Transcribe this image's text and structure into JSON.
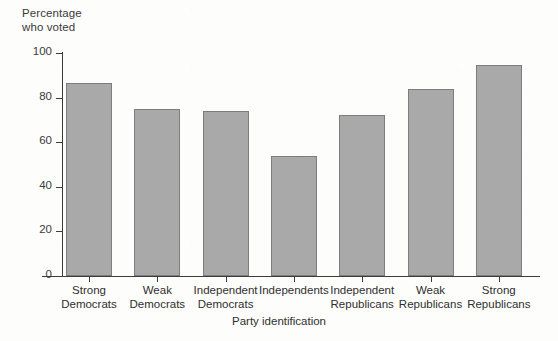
{
  "chart_data": {
    "type": "bar",
    "title": "",
    "xlabel": "Party identification",
    "ylabel": "Percentage who voted",
    "ylabel_lines": [
      "Percentage",
      "who voted"
    ],
    "categories": [
      "Strong Democrats",
      "Weak Democrats",
      "Independent Democrats",
      "Independents",
      "Independent Republicans",
      "Weak Republicans",
      "Strong Republicans"
    ],
    "category_lines": [
      [
        "Strong",
        "Democrats"
      ],
      [
        "Weak",
        "Democrats"
      ],
      [
        "Independent",
        "Democrats"
      ],
      [
        "Independents",
        ""
      ],
      [
        "Independent",
        "Republicans"
      ],
      [
        "Weak",
        "Republicans"
      ],
      [
        "Strong",
        "Republicans"
      ]
    ],
    "values": [
      86.5,
      75,
      74,
      54,
      72,
      84,
      94.5
    ],
    "ylim": [
      0,
      100
    ],
    "yticks": [
      0,
      20,
      40,
      60,
      80,
      100
    ],
    "ytick_labels": [
      "0",
      "20",
      "40",
      "60",
      "80",
      "100"
    ],
    "grid": false,
    "legend": false,
    "legend_position": "none",
    "bar_color": "#a9a9a9",
    "bar_edge_color": "#7d7d7d",
    "axis_color": "#3c3c3c",
    "background_color": "#fdfdfb"
  }
}
